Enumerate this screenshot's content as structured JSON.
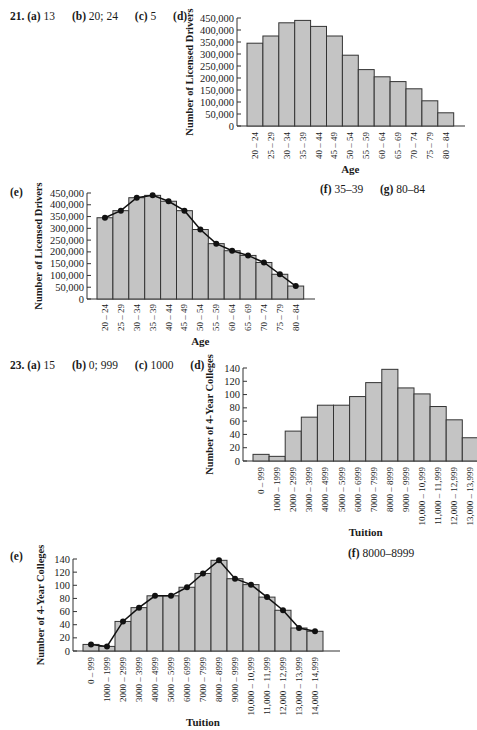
{
  "problem21": {
    "number": "21.",
    "a_label": "(a)",
    "a_value": "13",
    "b_label": "(b)",
    "b_value": "20; 24",
    "c_label": "(c)",
    "c_value": "5",
    "d_label": "(d)",
    "e_label": "(e)",
    "f_label": "(f)",
    "f_value": "35–39",
    "g_label": "(g)",
    "g_value": "80–84"
  },
  "problem23": {
    "number": "23.",
    "a_label": "(a)",
    "a_value": "15",
    "b_label": "(b)",
    "b_value": "0; 999",
    "c_label": "(c)",
    "c_value": "1000",
    "d_label": "(d)",
    "e_label": "(e)",
    "f_label": "(f)",
    "f_value": "8000–8999"
  },
  "colors": {
    "bar_fill": "#c4c4c4",
    "bar_stroke": "#333333",
    "line": "#111111",
    "axis": "#333333"
  },
  "chart_data": [
    {
      "id": "21d",
      "type": "bar",
      "title": "",
      "xlabel": "Age",
      "ylabel": "Number of Licensed Drivers",
      "categories": [
        "20 – 24",
        "25 – 29",
        "30 – 34",
        "35 – 39",
        "40 – 44",
        "45 – 49",
        "50 – 54",
        "55 – 59",
        "60 – 64",
        "65 – 69",
        "70 – 74",
        "75 – 79",
        "80 – 84"
      ],
      "values": [
        345000,
        375000,
        430000,
        440000,
        415000,
        375000,
        295000,
        235000,
        205000,
        185000,
        155000,
        105000,
        55000
      ],
      "yticks": [
        "0",
        "50,000",
        "100,000",
        "150,000",
        "200,000",
        "250,000",
        "300,000",
        "350,000",
        "400,000",
        "450,000"
      ],
      "ylim": [
        0,
        450000
      ],
      "grid": false
    },
    {
      "id": "21e",
      "type": "bar",
      "overlay": "line",
      "title": "",
      "xlabel": "Age",
      "ylabel": "Number of Licensed Drivers",
      "categories": [
        "20 – 24",
        "25 – 29",
        "30 – 34",
        "35 – 39",
        "40 – 44",
        "45 – 49",
        "50 – 54",
        "55 – 59",
        "60 – 64",
        "65 – 69",
        "70 – 74",
        "75 – 79",
        "80 – 84"
      ],
      "values": [
        345000,
        375000,
        430000,
        440000,
        415000,
        375000,
        295000,
        235000,
        205000,
        185000,
        155000,
        105000,
        55000
      ],
      "yticks": [
        "0",
        "50,000",
        "100,000",
        "150,000",
        "200,000",
        "250,000",
        "300,000",
        "350,000",
        "400,000",
        "450,000"
      ],
      "ylim": [
        0,
        450000
      ],
      "grid": false
    },
    {
      "id": "23d",
      "type": "bar",
      "title": "",
      "xlabel": "Tuition",
      "ylabel": "Number of 4-Year Colleges",
      "categories": [
        "0 – 999",
        "1000 – 1999",
        "2000 – 2999",
        "3000 – 3999",
        "4000 – 4999",
        "5000 – 5999",
        "6000 – 6999",
        "7000 – 7999",
        "8000 – 8999",
        "9000 – 9999",
        "10,000 – 10,999",
        "11,000 – 11,999",
        "12,000 – 12,999",
        "13,000 – 13,999"
      ],
      "values": [
        10,
        7,
        45,
        66,
        84,
        84,
        97,
        118,
        138,
        110,
        101,
        82,
        62,
        35
      ],
      "yticks": [
        "0",
        "20",
        "40",
        "60",
        "80",
        "100",
        "120",
        "140"
      ],
      "ylim": [
        0,
        140
      ],
      "grid": false
    },
    {
      "id": "23e",
      "type": "bar",
      "overlay": "line",
      "title": "",
      "xlabel": "Tuition",
      "ylabel": "Number of 4-Year Colleges",
      "categories": [
        "0 – 999",
        "1000 – 1999",
        "2000 – 2999",
        "3000 – 3999",
        "4000 – 4999",
        "5000 – 5999",
        "6000 – 6999",
        "7000 – 7999",
        "8000 – 8999",
        "9000 – 9999",
        "10,000 – 10,999",
        "11,000 – 11,999",
        "12,000 – 12,999",
        "13,000 – 13,999",
        "14,000 – 14,999"
      ],
      "values": [
        10,
        7,
        45,
        66,
        84,
        84,
        97,
        118,
        138,
        110,
        101,
        82,
        62,
        35,
        30
      ],
      "yticks": [
        "0",
        "20",
        "40",
        "60",
        "80",
        "100",
        "120",
        "140"
      ],
      "ylim": [
        0,
        140
      ],
      "grid": false
    }
  ]
}
